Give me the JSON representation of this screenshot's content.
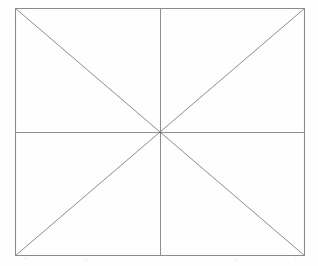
{
  "figure": {
    "canvas": {
      "width": 318,
      "height": 266
    },
    "background_color": "#fefefe",
    "stroke_color": "#8a8a8a",
    "stroke_width": 1,
    "rect": {
      "left": 15,
      "top": 8,
      "right": 305,
      "bottom": 256,
      "width": 290,
      "height": 248
    },
    "center": {
      "x": 160,
      "y": 132
    },
    "elements": [
      {
        "name": "border-top",
        "kind": "line",
        "x1": 15,
        "y1": 8,
        "x2": 305,
        "y2": 8
      },
      {
        "name": "border-right",
        "kind": "line",
        "x1": 305,
        "y1": 8,
        "x2": 305,
        "y2": 256
      },
      {
        "name": "border-bottom",
        "kind": "line",
        "x1": 15,
        "y1": 256,
        "x2": 305,
        "y2": 256
      },
      {
        "name": "border-left",
        "kind": "line",
        "x1": 15,
        "y1": 8,
        "x2": 15,
        "y2": 256
      },
      {
        "name": "vertical-median",
        "kind": "line",
        "x1": 160,
        "y1": 8,
        "x2": 160,
        "y2": 256
      },
      {
        "name": "horizontal-median",
        "kind": "line",
        "x1": 15,
        "y1": 132,
        "x2": 305,
        "y2": 132
      },
      {
        "name": "diagonal-tl-br",
        "kind": "line",
        "x1": 15,
        "y1": 8,
        "x2": 305,
        "y2": 256
      },
      {
        "name": "diagonal-tr-bl",
        "kind": "line",
        "x1": 305,
        "y1": 8,
        "x2": 15,
        "y2": 256
      }
    ],
    "line_count": 8,
    "labels": []
  }
}
